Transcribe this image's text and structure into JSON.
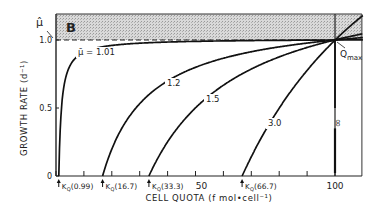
{
  "chart_data": {
    "type": "line",
    "panel_label": "B",
    "title": "",
    "xlabel": "CELL QUOTA (f mol•cell⁻¹)",
    "ylabel": "GROWTH RATE (d⁻¹)",
    "xlim": [
      0,
      110
    ],
    "ylim": [
      0,
      1.2
    ],
    "x_ticks": [
      0,
      10,
      20,
      30,
      40,
      50,
      60,
      70,
      80,
      90,
      100
    ],
    "x_tick_labels": [
      {
        "x": 50,
        "label": "50"
      },
      {
        "x": 100,
        "label": "100"
      }
    ],
    "y_tick_labels": [
      {
        "y": 0,
        "label": "0"
      },
      {
        "y": 0.5,
        "label": "0.5"
      },
      {
        "y": 1.0,
        "label": "1.0"
      }
    ],
    "mu_hat_label": "μ̂",
    "mu_hat_value": 1.0,
    "shaded_region": {
      "y_from": 1.0,
      "y_to": 1.19,
      "pattern": "stipple"
    },
    "qmax": {
      "x": 100,
      "label": "Q",
      "sub": "max"
    },
    "series": [
      {
        "name": "μ̄ = 1.01",
        "mu_bar": 1.01,
        "kq": 0.99
      },
      {
        "name": "1.2",
        "mu_bar": 1.2,
        "kq": 16.7
      },
      {
        "name": "1.5",
        "mu_bar": 1.5,
        "kq": 33.3
      },
      {
        "name": "3.0",
        "mu_bar": 3.0,
        "kq": 66.7
      },
      {
        "name": "∞",
        "mu_bar": "infinity",
        "kq": 100
      }
    ],
    "kq_markers": [
      {
        "x": 0.99,
        "label": "K",
        "sub": "Q",
        "value": "(0.99)"
      },
      {
        "x": 16.7,
        "label": "K",
        "sub": "Q",
        "value": "(16.7)"
      },
      {
        "x": 33.3,
        "label": "K",
        "sub": "Q",
        "value": "(33.3)"
      },
      {
        "x": 66.7,
        "label": "K",
        "sub": "Q",
        "value": "(66.7)"
      }
    ],
    "grid": false,
    "legend": "inline labels"
  }
}
